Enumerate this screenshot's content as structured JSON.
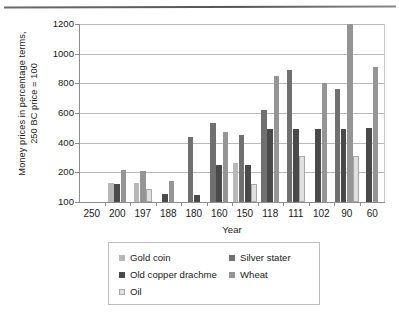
{
  "chart_data": {
    "type": "bar",
    "title": "",
    "xlabel": "Year",
    "ylabel": "Money prices in percentage terms,\n250 BC price = 100",
    "categories": [
      "250",
      "200",
      "197",
      "188",
      "180",
      "160",
      "150",
      "118",
      "111",
      "102",
      "90",
      "60"
    ],
    "yticks": [
      100,
      200,
      400,
      600,
      800,
      1000,
      1200
    ],
    "ylim": [
      100,
      1200
    ],
    "grid": true,
    "legend_position": "bottom",
    "series": [
      {
        "name": "Gold coin",
        "color": "#b8b8b8",
        "values": [
          null,
          165,
          165,
          null,
          null,
          null,
          265,
          null,
          null,
          null,
          null,
          null
        ]
      },
      {
        "name": "Silver stater",
        "color": "#707070",
        "values": [
          null,
          null,
          null,
          null,
          440,
          530,
          455,
          620,
          890,
          null,
          765,
          null
        ]
      },
      {
        "name": "Old copper drachme",
        "color": "#4a4a4a",
        "values": [
          null,
          160,
          null,
          128,
          125,
          250,
          250,
          490,
          490,
          495,
          495,
          500
        ]
      },
      {
        "name": "Wheat",
        "color": "#959595",
        "values": [
          null,
          215,
          210,
          170,
          null,
          470,
          null,
          850,
          null,
          800,
          1220,
          910
        ]
      },
      {
        "name": "Oil",
        "color": "#e0e0e0",
        "values": [
          null,
          null,
          145,
          null,
          null,
          null,
          160,
          null,
          310,
          null,
          310,
          null
        ]
      }
    ]
  },
  "axis": {
    "y_tick_labels": [
      "1200",
      "1000",
      "800",
      "600",
      "400",
      "200",
      "100"
    ],
    "x_tick_labels": [
      "250",
      "200",
      "197",
      "188",
      "180",
      "160",
      "150",
      "118",
      "111",
      "102",
      "90",
      "60"
    ],
    "x_title": "Year",
    "y_title": "Money prices in percentage terms,\n250 BC price = 100"
  },
  "legend": {
    "entries": [
      {
        "label": "Gold coin",
        "color": "#b8b8b8"
      },
      {
        "label": "Silver stater",
        "color": "#707070"
      },
      {
        "label": "Old copper drachme",
        "color": "#4a4a4a"
      },
      {
        "label": "Wheat",
        "color": "#959595"
      },
      {
        "label": "Oil",
        "color": "#e0e0e0"
      }
    ]
  }
}
